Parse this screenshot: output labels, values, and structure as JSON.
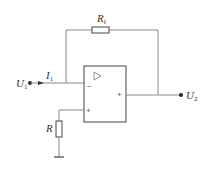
{
  "diagram": {
    "type": "inverting-op-amp-circuit",
    "colors": {
      "wire": "#888888",
      "component": "#444444",
      "text": "#333333",
      "background": "#ffffff"
    },
    "labels": {
      "input_voltage": {
        "main": "U",
        "sub": "1"
      },
      "output_voltage": {
        "main": "U",
        "sub": "2"
      },
      "input_current": {
        "main": "I",
        "sub": "1"
      },
      "feedback_resistor": {
        "main": "R",
        "sub": "f"
      },
      "ground_resistor": {
        "main": "R"
      }
    },
    "opamp": {
      "symbol": "▷",
      "inverting_sign": "−",
      "noninverting_sign": "+",
      "output_sign": "+"
    },
    "components": [
      {
        "id": "Rf",
        "kind": "resistor",
        "orientation": "horizontal",
        "role": "feedback"
      },
      {
        "id": "R",
        "kind": "resistor",
        "orientation": "vertical",
        "role": "balance-to-ground"
      },
      {
        "id": "A",
        "kind": "op-amp"
      },
      {
        "id": "GND",
        "kind": "ground"
      }
    ],
    "nodes": [
      "U1 input terminal",
      "U2 output terminal"
    ]
  }
}
